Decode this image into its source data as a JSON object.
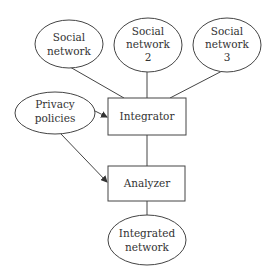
{
  "diagram": {
    "type": "flow",
    "colors": {
      "stroke": "#444444",
      "text": "#333333",
      "background": "#ffffff"
    },
    "nodes": [
      {
        "id": "sn1",
        "shape": "ellipse",
        "lines": [
          "Social",
          "network"
        ]
      },
      {
        "id": "sn2",
        "shape": "ellipse",
        "lines": [
          "Social",
          "network",
          "2"
        ]
      },
      {
        "id": "sn3",
        "shape": "ellipse",
        "lines": [
          "Social",
          "network",
          "3"
        ]
      },
      {
        "id": "privacy",
        "shape": "ellipse",
        "lines": [
          "Privacy",
          "policies"
        ]
      },
      {
        "id": "integrator",
        "shape": "rect",
        "lines": [
          "Integrator"
        ]
      },
      {
        "id": "analyzer",
        "shape": "rect",
        "lines": [
          "Analyzer"
        ]
      },
      {
        "id": "integrated",
        "shape": "ellipse",
        "lines": [
          "Integrated",
          "network"
        ]
      }
    ],
    "edges": [
      {
        "from": "sn1",
        "to": "integrator",
        "arrow": false
      },
      {
        "from": "sn2",
        "to": "integrator",
        "arrow": false
      },
      {
        "from": "sn3",
        "to": "integrator",
        "arrow": false
      },
      {
        "from": "privacy",
        "to": "integrator",
        "arrow": true
      },
      {
        "from": "privacy",
        "to": "analyzer",
        "arrow": true
      },
      {
        "from": "integrator",
        "to": "analyzer",
        "arrow": false
      },
      {
        "from": "analyzer",
        "to": "integrated",
        "arrow": false
      }
    ]
  }
}
